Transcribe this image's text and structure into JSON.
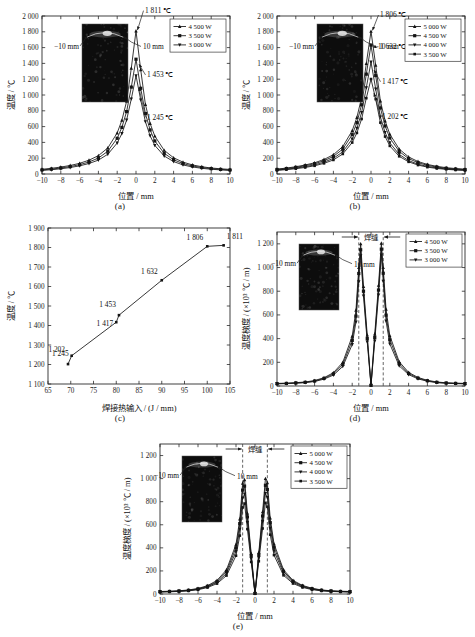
{
  "figure": {
    "panels": [
      "(a)",
      "(b)",
      "(c)",
      "(d)",
      "(e)"
    ],
    "inset_labels": {
      "left": "−10 mm",
      "right": "10 mm"
    },
    "weld_label": "焊缝"
  },
  "axis_titles": {
    "position": "位置 / mm",
    "temperature": "温度 / ℃",
    "heat_input": "焊接热输入 / (J / mm)",
    "gradient": "温度梯度 / (×10³ ℃ / m)"
  },
  "chart_data": [
    {
      "id": "a",
      "type": "line",
      "caption": "(a)",
      "title": "",
      "xlabel": "位置 / mm",
      "ylabel": "温度 / ℃",
      "xlim": [
        -10,
        10
      ],
      "ylim": [
        0,
        2000
      ],
      "xticks": [
        -10,
        -8,
        -6,
        -4,
        -2,
        0,
        2,
        4,
        6,
        8,
        10
      ],
      "yticks": [
        0,
        200,
        400,
        600,
        800,
        1000,
        1200,
        1400,
        1600,
        1800,
        2000
      ],
      "ytick_labels": [
        "0",
        "200",
        "400",
        "600",
        "800",
        "1 000",
        "1 200",
        "1 400",
        "1 600",
        "1 800",
        "2 000"
      ],
      "grid": false,
      "legend_position": "top-right",
      "x": [
        -10,
        -9,
        -8,
        -7,
        -6,
        -5,
        -4,
        -3,
        -2,
        -1.5,
        -1,
        -0.5,
        0,
        0.5,
        1,
        1.5,
        2,
        3,
        4,
        5,
        6,
        7,
        8,
        9,
        10
      ],
      "series": [
        {
          "name": "4 500 W",
          "marker": "triangle",
          "values": [
            60,
            72,
            88,
            108,
            135,
            175,
            232,
            330,
            520,
            680,
            920,
            1340,
            1811,
            1320,
            880,
            640,
            480,
            300,
            205,
            150,
            115,
            92,
            76,
            66,
            58
          ]
        },
        {
          "name": "3 500 W",
          "marker": "square",
          "values": [
            52,
            62,
            76,
            94,
            118,
            152,
            202,
            288,
            452,
            590,
            790,
            1100,
            1453,
            1085,
            765,
            558,
            418,
            262,
            180,
            132,
            102,
            82,
            68,
            58,
            51
          ]
        },
        {
          "name": "3 000 W",
          "marker": "triangle-down",
          "values": [
            45,
            54,
            66,
            82,
            103,
            133,
            176,
            250,
            392,
            512,
            682,
            950,
            1245,
            938,
            662,
            484,
            362,
            228,
            157,
            115,
            89,
            72,
            60,
            52,
            45
          ]
        }
      ],
      "annotations": [
        {
          "text": "1 811 ℃",
          "x": 0,
          "y": 1811
        },
        {
          "text": "1 453 ℃",
          "x": 0,
          "y": 1453
        },
        {
          "text": "1 245 ℃",
          "x": 0,
          "y": 1245
        }
      ]
    },
    {
      "id": "b",
      "type": "line",
      "caption": "(b)",
      "xlabel": "位置 / mm",
      "ylabel": "温度 / ℃",
      "xlim": [
        -10,
        10
      ],
      "ylim": [
        0,
        2000
      ],
      "xticks": [
        -10,
        -8,
        -6,
        -4,
        -2,
        0,
        2,
        4,
        6,
        8,
        10
      ],
      "yticks": [
        0,
        200,
        400,
        600,
        800,
        1000,
        1200,
        1400,
        1600,
        1800,
        2000
      ],
      "ytick_labels": [
        "0",
        "200",
        "400",
        "600",
        "800",
        "1 000",
        "1 200",
        "1 400",
        "1 600",
        "1 800",
        "2 000"
      ],
      "grid": false,
      "legend_position": "top-right",
      "x": [
        -10,
        -9,
        -8,
        -7,
        -6,
        -5,
        -4,
        -3,
        -2,
        -1.5,
        -1,
        -0.5,
        0,
        0.5,
        1,
        1.5,
        2,
        3,
        4,
        5,
        6,
        7,
        8,
        9,
        10
      ],
      "series": [
        {
          "name": "5 000 W",
          "marker": "triangle",
          "values": [
            62,
            75,
            92,
            114,
            142,
            184,
            244,
            348,
            548,
            716,
            968,
            1398,
            1806,
            1378,
            924,
            672,
            504,
            316,
            216,
            158,
            121,
            97,
            80,
            69,
            61
          ]
        },
        {
          "name": "4 500 W",
          "marker": "square",
          "values": [
            57,
            69,
            84,
            104,
            130,
            168,
            222,
            316,
            498,
            650,
            876,
            1264,
            1632,
            1246,
            836,
            608,
            456,
            286,
            195,
            143,
            110,
            88,
            73,
            63,
            56
          ]
        },
        {
          "name": "4 000 W",
          "marker": "triangle-down",
          "values": [
            51,
            61,
            75,
            92,
            116,
            150,
            198,
            282,
            442,
            578,
            778,
            1092,
            1417,
            1076,
            722,
            526,
            394,
            248,
            170,
            124,
            96,
            77,
            64,
            55,
            50
          ]
        },
        {
          "name": "3 500 W",
          "marker": "square-small",
          "values": [
            46,
            55,
            67,
            83,
            104,
            135,
            178,
            254,
            398,
            520,
            696,
            960,
            1202,
            948,
            650,
            474,
            356,
            224,
            154,
            113,
            87,
            70,
            59,
            51,
            45
          ]
        }
      ],
      "annotations": [
        {
          "text": "1 806 ℃",
          "x": 0,
          "y": 1806
        },
        {
          "text": "1 632 ℃",
          "x": 0,
          "y": 1632
        },
        {
          "text": "1 417 ℃",
          "x": 0,
          "y": 1417
        },
        {
          "text": "1 202 ℃",
          "x": 0,
          "y": 1202
        }
      ]
    },
    {
      "id": "c",
      "type": "line",
      "caption": "(c)",
      "xlabel": "焊接热输入 / (J / mm)",
      "ylabel": "温度 / ℃",
      "xlim": [
        65,
        105
      ],
      "ylim": [
        1100,
        1900
      ],
      "xticks": [
        65,
        70,
        75,
        80,
        85,
        90,
        95,
        100,
        105
      ],
      "yticks": [
        1100,
        1200,
        1300,
        1400,
        1500,
        1600,
        1700,
        1800,
        1900
      ],
      "ytick_labels": [
        "1 100",
        "1 200",
        "1 300",
        "1 400",
        "1 500",
        "1 600",
        "1 700",
        "1 800",
        "1 900"
      ],
      "grid": false,
      "legend_position": "none",
      "points": [
        {
          "x": 69.4,
          "y": 1202,
          "label": "1 202"
        },
        {
          "x": 70.2,
          "y": 1245,
          "label": "1 245"
        },
        {
          "x": 80.0,
          "y": 1417,
          "label": "1 417"
        },
        {
          "x": 80.6,
          "y": 1453,
          "label": "1 453"
        },
        {
          "x": 90.0,
          "y": 1632,
          "label": "1 632"
        },
        {
          "x": 100.0,
          "y": 1806,
          "label": "1 806"
        },
        {
          "x": 103.6,
          "y": 1811,
          "label": "1 811"
        }
      ]
    },
    {
      "id": "d",
      "type": "line",
      "caption": "(d)",
      "xlabel": "位置 / mm",
      "ylabel": "温度梯度 / (×10³ ℃ / m)",
      "xlim": [
        -10,
        10
      ],
      "ylim": [
        0,
        1300
      ],
      "xticks": [
        -10,
        -8,
        -6,
        -4,
        -2,
        0,
        2,
        4,
        6,
        8,
        10
      ],
      "yticks": [
        0,
        200,
        400,
        600,
        800,
        1000,
        1200
      ],
      "ytick_labels": [
        "0",
        "200",
        "400",
        "600",
        "800",
        "1 000",
        "1 200"
      ],
      "grid": false,
      "legend_position": "top-right",
      "weld_zone": [
        -1.3,
        1.3
      ],
      "x": [
        -10,
        -9,
        -8,
        -7,
        -6,
        -5,
        -4,
        -3,
        -2,
        -1.6,
        -1.3,
        -1.1,
        -0.8,
        -0.4,
        0,
        0.4,
        0.8,
        1.1,
        1.3,
        1.6,
        2,
        3,
        4,
        5,
        6,
        7,
        8,
        9,
        10
      ],
      "series": [
        {
          "name": "4 500 W",
          "marker": "triangle",
          "values": [
            22,
            24,
            28,
            34,
            46,
            70,
            112,
            200,
            420,
            640,
            1000,
            1200,
            840,
            430,
            8,
            440,
            850,
            1205,
            1000,
            648,
            425,
            205,
            115,
            72,
            48,
            34,
            27,
            24,
            22
          ]
        },
        {
          "name": "3 500 W",
          "marker": "square",
          "values": [
            20,
            22,
            26,
            31,
            42,
            64,
            102,
            182,
            385,
            590,
            950,
            1150,
            800,
            400,
            6,
            410,
            810,
            1155,
            952,
            598,
            390,
            188,
            106,
            66,
            44,
            31,
            25,
            22,
            20
          ]
        },
        {
          "name": "3 000 W",
          "marker": "triangle-down",
          "values": [
            18,
            20,
            23,
            28,
            38,
            58,
            92,
            165,
            350,
            540,
            880,
            1100,
            760,
            372,
            5,
            380,
            768,
            1105,
            884,
            548,
            355,
            170,
            96,
            60,
            40,
            28,
            23,
            20,
            18
          ]
        }
      ]
    },
    {
      "id": "e",
      "type": "line",
      "caption": "(e)",
      "xlabel": "位置 / mm",
      "ylabel": "温度梯度 / (×10³ ℃ / m)",
      "xlim": [
        -10,
        10
      ],
      "ylim": [
        0,
        1300
      ],
      "xticks": [
        -10,
        -8,
        -6,
        -4,
        -2,
        0,
        2,
        4,
        6,
        8,
        10
      ],
      "yticks": [
        0,
        200,
        400,
        600,
        800,
        1000,
        1200
      ],
      "ytick_labels": [
        "0",
        "200",
        "400",
        "600",
        "800",
        "1 000",
        "1 200"
      ],
      "grid": false,
      "legend_position": "top-right",
      "weld_zone": [
        -1.3,
        1.3
      ],
      "x": [
        -10,
        -9,
        -8,
        -7,
        -6,
        -5,
        -4,
        -3,
        -2,
        -1.6,
        -1.3,
        -1.1,
        -0.8,
        -0.4,
        0,
        0.4,
        0.8,
        1.1,
        1.3,
        1.6,
        2,
        3,
        4,
        5,
        6,
        7,
        8,
        9,
        10
      ],
      "series": [
        {
          "name": "5 000 W",
          "marker": "triangle",
          "values": [
            22,
            24,
            28,
            35,
            48,
            72,
            118,
            210,
            430,
            650,
            960,
            990,
            700,
            350,
            6,
            360,
            712,
            1000,
            965,
            658,
            435,
            210,
            118,
            74,
            50,
            35,
            28,
            24,
            22
          ]
        },
        {
          "name": "4 500 W",
          "marker": "square",
          "values": [
            20,
            22,
            26,
            32,
            44,
            67,
            108,
            194,
            400,
            610,
            900,
            935,
            668,
            330,
            5,
            338,
            676,
            942,
            905,
            618,
            406,
            196,
            110,
            69,
            46,
            33,
            26,
            22,
            20
          ]
        },
        {
          "name": "4 000 W",
          "marker": "triangle-down",
          "values": [
            19,
            21,
            24,
            30,
            41,
            62,
            100,
            178,
            368,
            562,
            830,
            866,
            620,
            306,
            4,
            314,
            628,
            872,
            836,
            570,
            374,
            180,
            101,
            63,
            42,
            30,
            24,
            21,
            19
          ]
        },
        {
          "name": "3 500 W",
          "marker": "square-small",
          "values": [
            17,
            19,
            22,
            27,
            37,
            56,
            90,
            160,
            332,
            506,
            750,
            784,
            562,
            278,
            4,
            284,
            568,
            790,
            756,
            514,
            337,
            162,
            91,
            57,
            38,
            27,
            22,
            19,
            17
          ]
        }
      ]
    }
  ]
}
